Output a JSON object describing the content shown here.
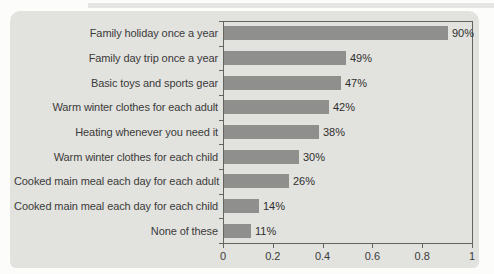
{
  "chart_data": {
    "type": "bar",
    "orientation": "horizontal",
    "title": "",
    "xlabel": "",
    "ylabel": "",
    "categories": [
      "Family holiday once a year",
      "Family day trip once a year",
      "Basic toys and sports gear",
      "Warm winter clothes for each adult",
      "Heating whenever you need it",
      "Warm winter clothes for each child",
      "Cooked main meal each day for each adult",
      "Cooked main meal each day for each child",
      "None of these"
    ],
    "values": [
      90,
      49,
      47,
      42,
      38,
      30,
      26,
      14,
      11
    ],
    "value_labels": [
      "90%",
      "49%",
      "47%",
      "42%",
      "38%",
      "30%",
      "26%",
      "14%",
      "11%"
    ],
    "xlim": [
      0,
      1
    ],
    "x_tick_labels": [
      "0",
      "0.2",
      "0.4",
      "0.6",
      "0.8",
      "1"
    ],
    "x_tick_values": [
      0,
      0.2,
      0.4,
      0.6,
      0.8,
      1
    ],
    "grid": false,
    "legend": null,
    "colors": {
      "bar": "#8f8f8d",
      "card_background": "#e2e2df",
      "page_background": "#fcfcfb",
      "axis_line": "#63635f",
      "text": "#3b3b39"
    }
  }
}
